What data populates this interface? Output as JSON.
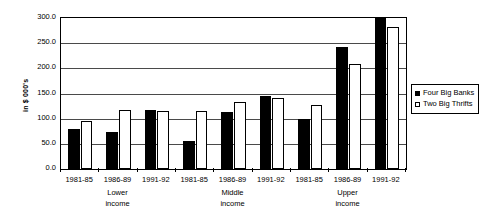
{
  "chart_data": {
    "type": "bar",
    "title": "",
    "xlabel": "",
    "ylabel": "in $ 000's",
    "ylim": [
      0,
      300
    ],
    "grid": true,
    "legend_position": "right",
    "y_ticks": [
      "0.0",
      "50.0",
      "100.0",
      "150.0",
      "200.0",
      "250.0",
      "300.0"
    ],
    "y_tick_values": [
      0,
      50,
      100,
      150,
      200,
      250,
      300
    ],
    "categories": [
      "1981-85",
      "1986-89",
      "1991-92",
      "1981-85",
      "1986-89",
      "1991-92",
      "1981-85",
      "1986-89",
      "1991-92"
    ],
    "groups": [
      {
        "label_line1": "Lower",
        "label_line2": "income"
      },
      {
        "label_line1": "Middle",
        "label_line2": "income"
      },
      {
        "label_line1": "Upper",
        "label_line2": "income"
      }
    ],
    "series": [
      {
        "name": "Four Big Banks",
        "color": "#000000",
        "style": "filled",
        "values": [
          80,
          74,
          117,
          56,
          114,
          145,
          100,
          242,
          300
        ]
      },
      {
        "name": "Two Big Thrifts",
        "color": "#ffffff",
        "style": "hollow",
        "values": [
          95,
          117,
          116,
          116,
          133,
          142,
          128,
          208,
          283
        ]
      }
    ]
  },
  "legend": {
    "entries": [
      {
        "label": "Four Big Banks",
        "swatch": "filled-square-icon"
      },
      {
        "label": "Two Big Thrifts",
        "swatch": "hollow-square-icon"
      }
    ]
  }
}
